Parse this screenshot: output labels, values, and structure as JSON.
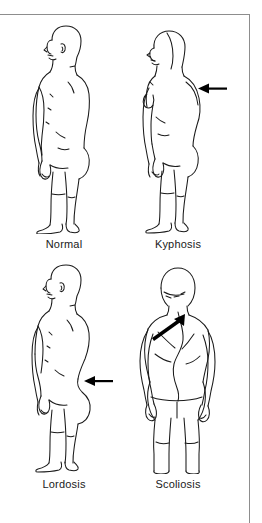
{
  "diagram": {
    "background_color": "#ffffff",
    "border_color": "#8d8d8d",
    "line_color": "#1a1a1a",
    "arrow_color": "#000000",
    "layout": "2x2 grid of anatomical line drawings"
  },
  "figures": [
    {
      "id": "normal",
      "label": "Normal",
      "view": "lateral (side) view, facing left",
      "sex": "male",
      "arrow": "none",
      "description": "Upright standing figure with normal spinal alignment"
    },
    {
      "id": "kyphosis",
      "label": "Kyphosis",
      "view": "lateral (side) view, facing left",
      "sex": "female",
      "arrow": "left-pointing arrow at upper thoracic back",
      "description": "Exaggerated outward rounding of the upper back"
    },
    {
      "id": "lordosis",
      "label": "Lordosis",
      "view": "lateral (side) view, facing left",
      "sex": "male",
      "arrow": "left-pointing arrow at lower lumbar back",
      "description": "Exaggerated inward curve of the lower back"
    },
    {
      "id": "scoliosis",
      "label": "Scoliosis",
      "view": "posterior (rear) view",
      "sex": "female",
      "arrow": "diagonal arrow pointing up and to the right at the spine",
      "description": "Sideways lateral curvature of the spine"
    }
  ]
}
